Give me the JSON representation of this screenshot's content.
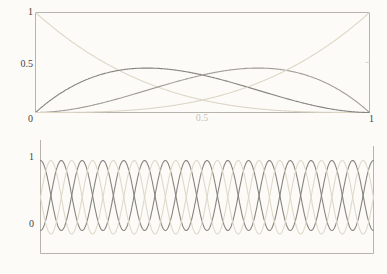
{
  "figure": {
    "background": "#fcfbf8"
  },
  "colors": {
    "frame": "#b8b4ac",
    "text": "#45443f",
    "faint_text": "#c9c4b8",
    "dark_curve": "#85837e",
    "dark2_curve": "#a09c95",
    "light_curve": "#dcd6c5",
    "bottom_dark_curve": "#87857f",
    "bottom_light_curve": "#ded9c9"
  },
  "axes": {
    "top": {
      "y1": "1",
      "y05": "0.5",
      "origin": "0",
      "x05": "0.5",
      "x1": "1"
    },
    "bottom": {
      "y1": "1",
      "y0": "0"
    }
  },
  "chart_data": [
    {
      "type": "line",
      "title": "",
      "xlabel": "",
      "ylabel": "",
      "xlim": [
        0,
        1
      ],
      "ylim": [
        0,
        1
      ],
      "x_ticks": [
        "0",
        "0.5",
        "1"
      ],
      "y_ticks": [
        "0",
        "0.5",
        "1"
      ],
      "grid": false,
      "legend": "none",
      "description": "Cubic Bernstein basis polynomials B_i,3(t) on [0,1]; pale curves B0 and B3, darker curves B1 and B2",
      "x_samples": [
        0,
        0.1,
        0.2,
        0.3,
        0.4,
        0.5,
        0.6,
        0.7,
        0.8,
        0.9,
        1
      ],
      "series": [
        {
          "name": "B0,3 = (1-t)^3",
          "color": "#dcd6c5",
          "params": {
            "kind": "bernstein",
            "i": 0,
            "n": 3
          },
          "values": [
            1,
            0.729,
            0.512,
            0.343,
            0.216,
            0.125,
            0.064,
            0.027,
            0.008,
            0.001,
            0
          ]
        },
        {
          "name": "B1,3 = 3t(1-t)^2",
          "color": "#85837e",
          "params": {
            "kind": "bernstein",
            "i": 1,
            "n": 3
          },
          "values": [
            0,
            0.243,
            0.384,
            0.441,
            0.432,
            0.375,
            0.288,
            0.189,
            0.096,
            0.027,
            0
          ]
        },
        {
          "name": "B2,3 = 3t^2(1-t)",
          "color": "#a09c95",
          "params": {
            "kind": "bernstein",
            "i": 2,
            "n": 3
          },
          "values": [
            0,
            0.027,
            0.096,
            0.189,
            0.288,
            0.375,
            0.432,
            0.441,
            0.384,
            0.243,
            0
          ]
        },
        {
          "name": "B3,3 = t^3",
          "color": "#dcd6c5",
          "params": {
            "kind": "bernstein",
            "i": 3,
            "n": 3
          },
          "values": [
            0,
            0.001,
            0.008,
            0.027,
            0.064,
            0.125,
            0.216,
            0.343,
            0.512,
            0.729,
            1
          ]
        }
      ]
    },
    {
      "type": "line",
      "title": "",
      "xlabel": "",
      "ylabel": "",
      "xlim": [
        0,
        1
      ],
      "ylim": [
        -0.08,
        1.05
      ],
      "y_ticks": [
        "0",
        "1"
      ],
      "grid": false,
      "legend": "none",
      "description": "Eight cycles of crossing squared-sinusoid curves; two dark curves cos^2/sin^2(8 pi x), two pale quarter-period-shifted curves whose minima dip slightly below 0",
      "series": [
        {
          "name": "cos^2(8 pi x)",
          "color": "#87857f",
          "params": {
            "kind": "sqcos",
            "cycles": 8,
            "phase_deg": 0,
            "scale": 1,
            "offset": 0
          }
        },
        {
          "name": "sin^2(8 pi x)",
          "color": "#87857f",
          "params": {
            "kind": "sqcos",
            "cycles": 8,
            "phase_deg": 90,
            "scale": 1,
            "offset": 0
          }
        },
        {
          "name": "cos^2(8 pi x - pi/4)",
          "color": "#ded9c9",
          "params": {
            "kind": "sqcos",
            "cycles": 8,
            "phase_deg": 45,
            "scale": 1.05,
            "offset": -0.05
          }
        },
        {
          "name": "sin^2(8 pi x - pi/4)",
          "color": "#ded9c9",
          "params": {
            "kind": "sqcos",
            "cycles": 8,
            "phase_deg": 135,
            "scale": 1.05,
            "offset": -0.05
          }
        }
      ]
    }
  ]
}
